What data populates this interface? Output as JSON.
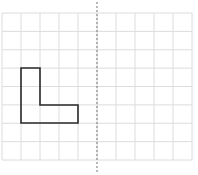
{
  "diagram": {
    "type": "grid-reflection",
    "grid": {
      "columns": 10,
      "rows": 8,
      "left": 2,
      "top": 13,
      "right": 192,
      "bottom": 160,
      "line_color": "#dcdcdc"
    },
    "mirror_line": {
      "orientation": "vertical",
      "x": 97,
      "y1": 2,
      "y2": 173,
      "style": "dashed",
      "color": "#8a8a8a"
    },
    "shape": {
      "name": "L-shape",
      "stroke_color": "#2a2a2a",
      "points": [
        [
          21,
          68
        ],
        [
          40,
          68
        ],
        [
          40,
          105
        ],
        [
          78,
          105
        ],
        [
          78,
          123
        ],
        [
          21,
          123
        ]
      ]
    }
  }
}
